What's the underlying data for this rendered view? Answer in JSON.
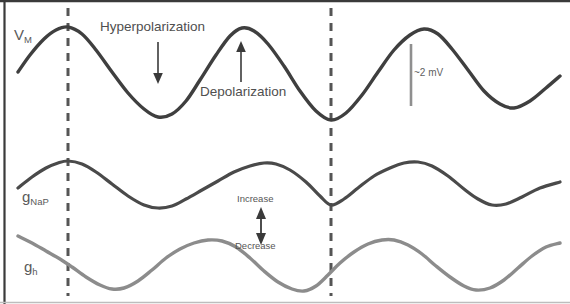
{
  "figure": {
    "background_color": "#ffffff",
    "border_color": "#3a3a3a",
    "width": 570,
    "height": 304
  },
  "traces": {
    "vm": {
      "label": "V",
      "label_sub": "M",
      "color": "#3f3f3f",
      "stroke_width": 3.4,
      "description": "Membrane potential subthreshold oscillation"
    },
    "gnap": {
      "label": "g",
      "label_sub": "NaP",
      "color": "#4a4a4a",
      "stroke_width": 3.2,
      "description": "Persistent sodium conductance"
    },
    "gh": {
      "label": "g",
      "label_sub": "h",
      "color": "#8c8c8c",
      "stroke_width": 3.4,
      "description": "H-current conductance"
    }
  },
  "annotations": {
    "hyperpolarization": "Hyperpolarization",
    "depolarization": "Depolarization",
    "increase": "Increase",
    "decrease": "Decrease",
    "scale_bar": "~2 mV"
  },
  "markers": {
    "dashed_line_color": "#555555",
    "dashed_line_1_x": 68,
    "dashed_line_2_x": 331,
    "scale_bar_color": "#8f8f8f",
    "scale_bar_x": 411,
    "scale_bar_y_top": 44,
    "scale_bar_y_bottom": 106,
    "arrow_color": "#3a3a3a"
  },
  "chart_data": {
    "type": "line",
    "title": "",
    "xlabel": "",
    "ylabel": "",
    "grid": false,
    "legend": "inline-left-labels",
    "series": [
      {
        "name": "V_M",
        "color": "#3f3f3f",
        "points": [
          [
            18,
            72
          ],
          [
            30,
            55
          ],
          [
            44,
            39
          ],
          [
            56,
            30
          ],
          [
            68,
            27
          ],
          [
            82,
            34
          ],
          [
            96,
            50
          ],
          [
            112,
            72
          ],
          [
            128,
            93
          ],
          [
            144,
            109
          ],
          [
            158,
            117
          ],
          [
            172,
            114
          ],
          [
            186,
            101
          ],
          [
            200,
            80
          ],
          [
            216,
            55
          ],
          [
            230,
            36
          ],
          [
            242,
            28
          ],
          [
            254,
            31
          ],
          [
            268,
            44
          ],
          [
            284,
            66
          ],
          [
            300,
            91
          ],
          [
            316,
            111
          ],
          [
            331,
            120
          ],
          [
            346,
            113
          ],
          [
            362,
            95
          ],
          [
            378,
            72
          ],
          [
            394,
            50
          ],
          [
            410,
            35
          ],
          [
            424,
            29
          ],
          [
            438,
            34
          ],
          [
            452,
            49
          ],
          [
            468,
            70
          ],
          [
            484,
            91
          ],
          [
            500,
            104
          ],
          [
            514,
            108
          ],
          [
            530,
            101
          ],
          [
            546,
            88
          ],
          [
            560,
            76
          ]
        ]
      },
      {
        "name": "g_NaP",
        "color": "#4a4a4a",
        "points": [
          [
            18,
            188
          ],
          [
            32,
            177
          ],
          [
            46,
            168
          ],
          [
            58,
            163
          ],
          [
            68,
            161
          ],
          [
            82,
            164
          ],
          [
            96,
            172
          ],
          [
            112,
            184
          ],
          [
            128,
            196
          ],
          [
            144,
            205
          ],
          [
            158,
            208
          ],
          [
            172,
            206
          ],
          [
            186,
            199
          ],
          [
            202,
            190
          ],
          [
            218,
            181
          ],
          [
            234,
            172
          ],
          [
            250,
            166
          ],
          [
            264,
            163
          ],
          [
            276,
            164
          ],
          [
            290,
            170
          ],
          [
            306,
            182
          ],
          [
            320,
            196
          ],
          [
            331,
            205
          ],
          [
            344,
            199
          ],
          [
            358,
            188
          ],
          [
            374,
            176
          ],
          [
            390,
            168
          ],
          [
            404,
            163
          ],
          [
            418,
            162
          ],
          [
            432,
            166
          ],
          [
            448,
            176
          ],
          [
            464,
            189
          ],
          [
            478,
            199
          ],
          [
            492,
            205
          ],
          [
            506,
            204
          ],
          [
            522,
            197
          ],
          [
            540,
            188
          ],
          [
            560,
            182
          ]
        ]
      },
      {
        "name": "g_h",
        "color": "#8c8c8c",
        "points": [
          [
            18,
            236
          ],
          [
            32,
            243
          ],
          [
            46,
            251
          ],
          [
            60,
            259
          ],
          [
            72,
            267
          ],
          [
            86,
            277
          ],
          [
            100,
            285
          ],
          [
            112,
            289
          ],
          [
            124,
            288
          ],
          [
            138,
            281
          ],
          [
            152,
            270
          ],
          [
            166,
            258
          ],
          [
            180,
            249
          ],
          [
            194,
            243
          ],
          [
            208,
            240
          ],
          [
            222,
            241
          ],
          [
            236,
            247
          ],
          [
            250,
            258
          ],
          [
            264,
            271
          ],
          [
            278,
            282
          ],
          [
            292,
            289
          ],
          [
            304,
            291
          ],
          [
            316,
            286
          ],
          [
            328,
            275
          ],
          [
            340,
            263
          ],
          [
            354,
            252
          ],
          [
            368,
            244
          ],
          [
            382,
            240
          ],
          [
            394,
            240
          ],
          [
            408,
            245
          ],
          [
            422,
            254
          ],
          [
            436,
            266
          ],
          [
            450,
            277
          ],
          [
            464,
            286
          ],
          [
            476,
            290
          ],
          [
            490,
            288
          ],
          [
            504,
            280
          ],
          [
            518,
            268
          ],
          [
            532,
            256
          ],
          [
            546,
            247
          ],
          [
            560,
            243
          ]
        ]
      }
    ]
  }
}
